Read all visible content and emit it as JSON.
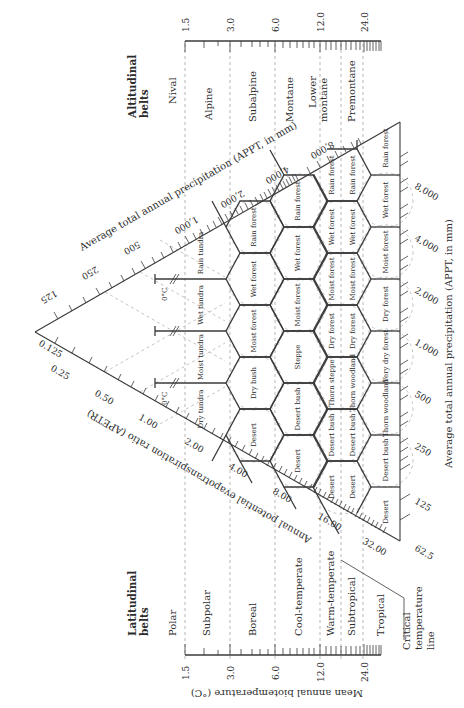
{
  "diagram": {
    "altitudinal_belts": {
      "title_line1": "Altitudinal",
      "title_line2": "belts",
      "items": [
        "Nival",
        "Alpine",
        "Subalpine",
        "Montane",
        "Lower",
        "montane",
        "Premontane"
      ]
    },
    "latitudinal_belts": {
      "title_line1": "Latitudinal",
      "title_line2": "belts",
      "items": [
        "Polar",
        "Subpolar",
        "Boreal",
        "Cool-temperate",
        "Warm-temperate",
        "Subtropical",
        "Tropical"
      ]
    },
    "critical_line": {
      "line1": "Critical",
      "line2": "temperature",
      "line3": "line"
    },
    "biotemperature_axis": {
      "label": "Mean annual biotemperature (°C)",
      "ticks": [
        "1.5",
        "3.0",
        "6.0",
        "12.0",
        "24.0"
      ]
    },
    "precip_axis_top": {
      "label": "Average total annual precipitation (APPT, in mm)",
      "ticks": [
        "125",
        "250",
        "500",
        "1,000",
        "2,000",
        "4,000",
        "8,000"
      ]
    },
    "precip_axis_right": {
      "label": "Average total annual precipitation (APPT, in mm)",
      "ticks": [
        "62.5",
        "125",
        "250",
        "500",
        "1,000",
        "2,000",
        "4,000",
        "8,000"
      ]
    },
    "pet_axis": {
      "label": "Annual potential evapotranspiration ratio (APETR)",
      "ticks": [
        "0.125",
        "0.25",
        "0.50",
        "1.00",
        "2.00",
        "4.00",
        "8.00",
        "16.00",
        "32.00"
      ]
    },
    "frost_marker": "0°C",
    "zones": {
      "polar": [
        "Rain tundra",
        "Wet tundra",
        "Moist tundra",
        "Dry tundra"
      ],
      "boreal": [
        "Rain forest",
        "Wet forest",
        "Moist forest",
        "Dry bush",
        "Desert"
      ],
      "cool_temperate": [
        "Rain forest",
        "Wet forest",
        "Moist forest",
        "Steppe",
        "Desert bush",
        "Desert"
      ],
      "warm_temperate": [
        "Rain forest",
        "Wet forest",
        "Moist forest",
        "Dry forest",
        "Thorn steppe",
        "Desert bush",
        "Desert"
      ],
      "subtropical": [
        "Rain forest",
        "Wet forest",
        "Moist forest",
        "Dry forest",
        "Thorn woodland",
        "Desert bush",
        "Desert"
      ],
      "tropical": [
        "Rain forest",
        "Wet forest",
        "Moist forest",
        "Dry forest",
        "Very dry forest",
        "Thorn woodland",
        "Desert bush",
        "Desert"
      ]
    }
  }
}
